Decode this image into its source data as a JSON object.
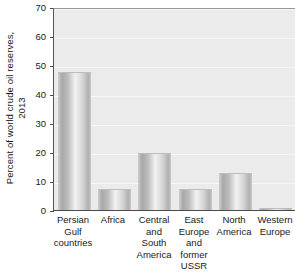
{
  "chart_data": {
    "type": "bar",
    "title": "",
    "xlabel": "",
    "ylabel": "Percent of world crude oil reserves, 2013",
    "ylabel_lines": [
      "Percent of world crude oil reserves,",
      "2013"
    ],
    "ylim": [
      0,
      70
    ],
    "yticks": [
      0,
      10,
      20,
      30,
      40,
      50,
      60,
      70
    ],
    "ytick_labels": [
      "0",
      "10",
      "20",
      "30",
      "40",
      "50",
      "60",
      "70"
    ],
    "grid": true,
    "legend": false,
    "categories": [
      "Persian Gulf countries",
      "Africa",
      "Central and South America",
      "East Europe and former USSR",
      "North America",
      "Western Europe"
    ],
    "category_lines": [
      [
        "Persian",
        "Gulf",
        "countries"
      ],
      [
        "Africa"
      ],
      [
        "Central",
        "and",
        "South",
        "America"
      ],
      [
        "East",
        "Europe",
        "and",
        "former",
        "USSR"
      ],
      [
        "North",
        "America"
      ],
      [
        "Western",
        "Europe"
      ]
    ],
    "values": [
      48,
      7.5,
      20,
      7.5,
      13,
      1
    ]
  },
  "style": {
    "plot_background": "#ebebeb",
    "gridline_color": "#f7f7f7",
    "axis_color": "#4a4a4a",
    "bar_light": "#f2f2f2",
    "bar_dark": "#a8a8a8",
    "text_color": "#1a1a1a"
  }
}
